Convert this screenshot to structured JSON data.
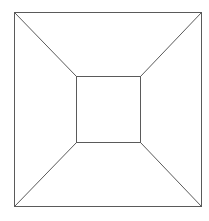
{
  "diagram": {
    "type": "truncated-pyramid-top-view",
    "stroke_color": "#5a5a5a",
    "background": "#ffffff",
    "outer_square": {
      "x1": 14,
      "y1": 12,
      "x2": 201,
      "y2": 206
    },
    "inner_square": {
      "x1": 76,
      "y1": 76,
      "x2": 140,
      "y2": 142
    }
  }
}
